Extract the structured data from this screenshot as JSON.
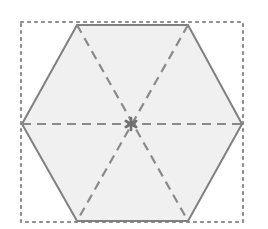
{
  "figure": {
    "canvas": {
      "width": 268,
      "height": 229,
      "background": "#ffffff"
    },
    "bounding_box": {
      "name": "dotted-bounding-square",
      "x": 21,
      "y": 22,
      "width": 222,
      "height": 200,
      "stroke": "#8c8c8c",
      "stroke_width": 2.2,
      "dash_pattern": "2 5",
      "style": "dotted",
      "fill": "none"
    },
    "hexagon": {
      "name": "regular-hexagon",
      "orientation": "flat-top",
      "fill": "#f0f0f0",
      "stroke": "#808080",
      "stroke_width": 2,
      "vertices": [
        {
          "label": "left",
          "x": 22,
          "y": 124
        },
        {
          "label": "top-left",
          "x": 77,
          "y": 25
        },
        {
          "label": "top-right",
          "x": 188,
          "y": 25
        },
        {
          "label": "right",
          "x": 242,
          "y": 124
        },
        {
          "label": "bottom-right",
          "x": 188,
          "y": 221
        },
        {
          "label": "bottom-left",
          "x": 77,
          "y": 221
        }
      ]
    },
    "diagonals": {
      "name": "dashed-main-diagonals",
      "stroke": "#8a8a8a",
      "stroke_width": 2.2,
      "dash_pattern": "9 6",
      "lines": [
        {
          "label": "horizontal-diagonal",
          "x1": 22,
          "y1": 124,
          "x2": 242,
          "y2": 124
        },
        {
          "label": "diagonal-top-left-to-bottom-right",
          "x1": 77,
          "y1": 25,
          "x2": 188,
          "y2": 221
        },
        {
          "label": "diagonal-top-right-to-bottom-left",
          "x1": 188,
          "y1": 25,
          "x2": 77,
          "y2": 221
        }
      ]
    },
    "center_marker": {
      "name": "center-asterisk-marker",
      "x": 131,
      "y": 124,
      "glyph": "asterisk",
      "color": "#707070",
      "radius": 6,
      "spokes": 6
    }
  }
}
